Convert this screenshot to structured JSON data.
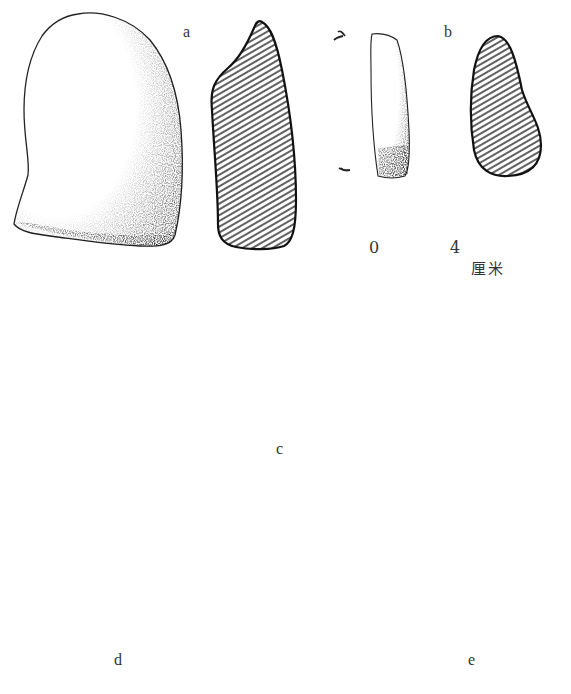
{
  "figure": {
    "type": "archaeological line drawing of stone artifacts with cross-sections",
    "colors": {
      "ink": "#222222",
      "hatch": "#444444",
      "background": "#ffffff"
    },
    "artifacts": [
      {
        "label": "a",
        "views": [
          "surface-view",
          "cross-section"
        ]
      },
      {
        "label": "b",
        "views": [
          "surface-view",
          "cross-section"
        ]
      },
      {
        "label": "c",
        "views": [
          "surface-view",
          "cross-section"
        ]
      },
      {
        "label": "d",
        "views": [
          "surface-view",
          "cross-section"
        ]
      },
      {
        "label": "e",
        "views": [
          "surface-view",
          "cross-section"
        ]
      }
    ],
    "scale_bar": {
      "start": "0",
      "end": "4",
      "unit": "厘米"
    }
  }
}
